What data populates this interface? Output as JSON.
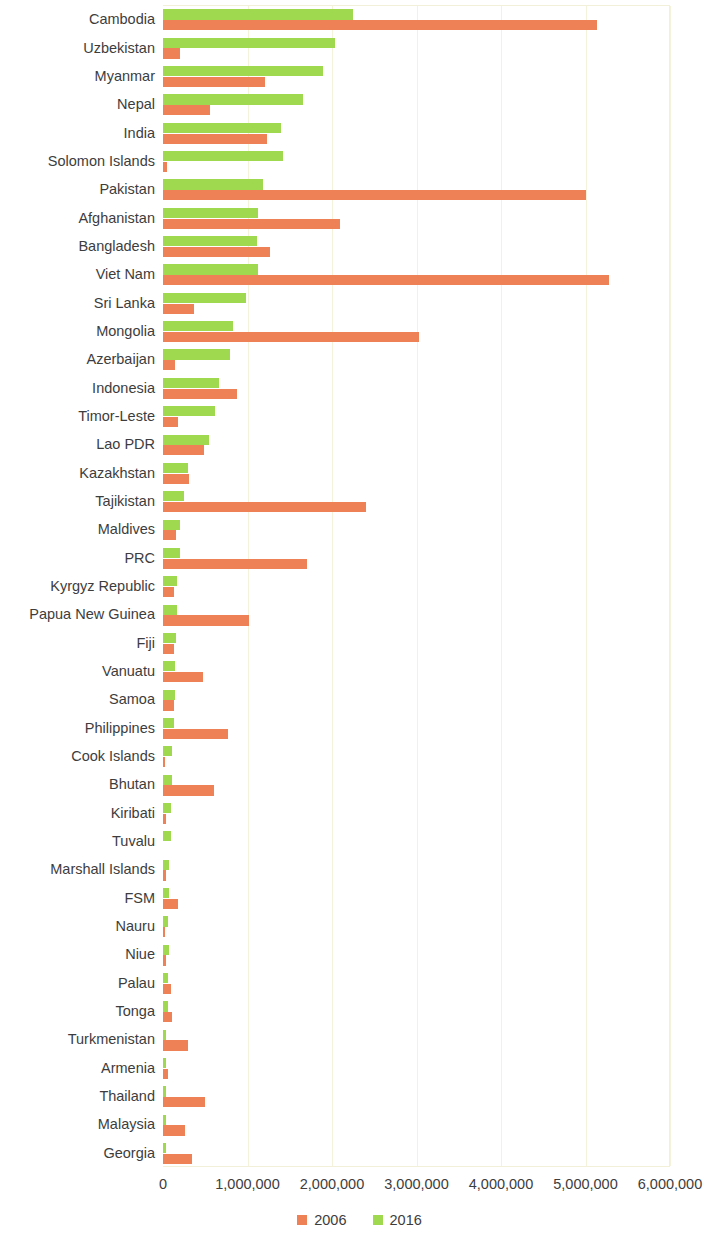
{
  "chart": {
    "type": "bar",
    "orientation": "horizontal",
    "grouped": true
  },
  "legend": {
    "position": "bottom-center",
    "items": [
      {
        "label": "2006",
        "color": "#ef8157"
      },
      {
        "label": "2016",
        "color": "#9ed950"
      }
    ]
  },
  "axis": {
    "x_ticks": [
      "0",
      "1,000,000",
      "2,000,000",
      "3,000,000",
      "4,000,000",
      "5,000,000",
      "6,000,000"
    ],
    "x_tick_values": [
      0,
      1000000,
      2000000,
      3000000,
      4000000,
      5000000,
      6000000
    ],
    "xlim": [
      0,
      6000000
    ],
    "grid": "vertical"
  },
  "chart_data": {
    "type": "bar",
    "title": "",
    "xlabel": "",
    "ylabel": "",
    "xlim": [
      0,
      6000000
    ],
    "grid": true,
    "legend_position": "bottom",
    "categories": [
      "Cambodia",
      "Uzbekistan",
      "Myanmar",
      "Nepal",
      "India",
      "Solomon Islands",
      "Pakistan",
      "Afghanistan",
      "Bangladesh",
      "Viet Nam",
      "Sri Lanka",
      "Mongolia",
      "Azerbaijan",
      "Indonesia",
      "Timor-Leste",
      "Lao PDR",
      "Kazakhstan",
      "Tajikistan",
      "Maldives",
      "PRC",
      "Kyrgyz Republic",
      "Papua New Guinea",
      "Fiji",
      "Vanuatu",
      "Samoa",
      "Philippines",
      "Cook Islands",
      "Bhutan",
      "Kiribati",
      "Tuvalu",
      "Marshall Islands",
      "FSM",
      "Nauru",
      "Niue",
      "Palau",
      "Tonga",
      "Turkmenistan",
      "Armenia",
      "Thailand",
      "Malaysia",
      "Georgia"
    ],
    "series": [
      {
        "name": "2006",
        "color": "#ef8157",
        "values": [
          5140000,
          200000,
          1210000,
          560000,
          1230000,
          50000,
          5000000,
          2100000,
          1270000,
          5280000,
          370000,
          3030000,
          140000,
          880000,
          180000,
          480000,
          310000,
          2400000,
          150000,
          1700000,
          130000,
          1020000,
          130000,
          470000,
          130000,
          770000,
          20000,
          600000,
          40000,
          0,
          30000,
          180000,
          20000,
          40000,
          100000,
          110000,
          290000,
          55000,
          500000,
          260000,
          340000
        ]
      },
      {
        "name": "2016",
        "color": "#9ed950",
        "values": [
          2250000,
          2030000,
          1890000,
          1660000,
          1400000,
          1420000,
          1180000,
          1120000,
          1110000,
          1120000,
          980000,
          830000,
          790000,
          660000,
          610000,
          540000,
          290000,
          250000,
          200000,
          200000,
          170000,
          170000,
          150000,
          140000,
          140000,
          130000,
          110000,
          110000,
          90000,
          100000,
          75000,
          70000,
          65000,
          70000,
          60000,
          60000,
          40000,
          40000,
          35000,
          30000,
          35000
        ]
      }
    ]
  }
}
